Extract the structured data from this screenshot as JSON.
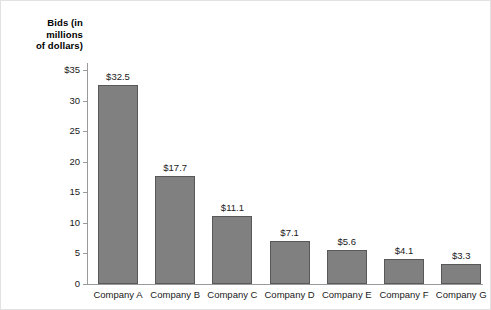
{
  "chart_data": {
    "type": "bar",
    "title": "",
    "xlabel": "",
    "ylabel": "Bids (in millions of dollars)",
    "ylabel_lines": [
      "Bids (in",
      "millions",
      "of dollars)"
    ],
    "categories": [
      "Company A",
      "Company B",
      "Company C",
      "Company D",
      "Company E",
      "Company F",
      "Company G"
    ],
    "values": [
      32.5,
      17.7,
      11.1,
      7.1,
      5.6,
      4.1,
      3.3
    ],
    "data_labels": [
      "$32.5",
      "$17.7",
      "$11.1",
      "$7.1",
      "$5.6",
      "$4.1",
      "$3.3"
    ],
    "ylim": [
      0,
      35
    ],
    "ytick_values": [
      0,
      5,
      10,
      15,
      20,
      25,
      30,
      35
    ],
    "ytick_labels": [
      "0",
      "5",
      "10",
      "15",
      "20",
      "25",
      "30",
      "$35"
    ],
    "grid": false,
    "legend": null,
    "bar_color": "#808080",
    "bar_border_color": "#585858",
    "axis_color": "#9a9a9a",
    "background": "#ffffff"
  }
}
